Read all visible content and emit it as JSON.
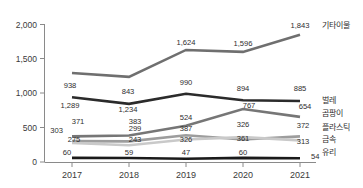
{
  "chart_data": {
    "type": "line",
    "title": "",
    "xlabel": "",
    "ylabel": "",
    "ylim": [
      0,
      2000
    ],
    "grid": false,
    "legend_position": "right-inline",
    "categories": [
      "2017",
      "2018",
      "2019",
      "2020",
      "2021"
    ],
    "y_ticks": [
      "0",
      "500",
      "1,000",
      "1,500",
      "2,000"
    ],
    "y_tick_values": [
      0,
      500,
      1000,
      1500,
      2000
    ],
    "series": [
      {
        "name": "기타이물",
        "color": "#6f6f6f",
        "values": [
          1289,
          1234,
          1624,
          1596,
          1843
        ],
        "labels": [
          "1,289",
          "1,234",
          "1,624",
          "1,596",
          "1,843"
        ]
      },
      {
        "name": "벌레",
        "color": "#2b2b2b",
        "values": [
          938,
          843,
          990,
          894,
          885
        ],
        "labels": [
          "938",
          "843",
          "990",
          "894",
          "885"
        ]
      },
      {
        "name": "곰팡이",
        "color": "#767676",
        "values": [
          371,
          383,
          524,
          767,
          654
        ],
        "labels": [
          "371",
          "383",
          "524",
          "767",
          "654"
        ]
      },
      {
        "name": "플라스틱",
        "color": "#9d9d9d",
        "values": [
          303,
          299,
          387,
          326,
          372
        ],
        "labels": [
          "303",
          "299",
          "387",
          "326",
          "372"
        ]
      },
      {
        "name": "금속",
        "color": "#c9c9c9",
        "values": [
          275,
          243,
          326,
          361,
          313
        ],
        "labels": [
          "275",
          "243",
          "326",
          "361",
          "313"
        ]
      },
      {
        "name": "유리",
        "color": "#1a1a1a",
        "values": [
          60,
          59,
          47,
          60,
          54
        ],
        "labels": [
          "60",
          "59",
          "47",
          "60",
          "54"
        ]
      }
    ]
  },
  "axis": {
    "y": {
      "t0": "0",
      "t1": "500",
      "t2": "1,000",
      "t3": "1,500",
      "t4": "2,000"
    },
    "x": {
      "t0": "2017",
      "t1": "2018",
      "t2": "2019",
      "t3": "2020",
      "t4": "2021"
    }
  },
  "legend": {
    "s0": "기타이물",
    "s1": "벌레",
    "s2": "곰팡이",
    "s3": "플라스틱",
    "s4": "금속",
    "s5": "유리"
  },
  "labels": {
    "s0": {
      "v0": "1,289",
      "v1": "1,234",
      "v2": "1,624",
      "v3": "1,596",
      "v4": "1,843"
    },
    "s1": {
      "v0": "938",
      "v1": "843",
      "v2": "990",
      "v3": "894",
      "v4": "885"
    },
    "s2": {
      "v0": "371",
      "v1": "383",
      "v2": "524",
      "v3": "767",
      "v4": "654"
    },
    "s3": {
      "v0": "303",
      "v1": "299",
      "v2": "387",
      "v3": "326",
      "v4": "372"
    },
    "s4": {
      "v0": "275",
      "v1": "243",
      "v2": "326",
      "v3": "361",
      "v4": "313"
    },
    "s5": {
      "v0": "60",
      "v1": "59",
      "v2": "47",
      "v3": "60",
      "v4": "54"
    }
  }
}
